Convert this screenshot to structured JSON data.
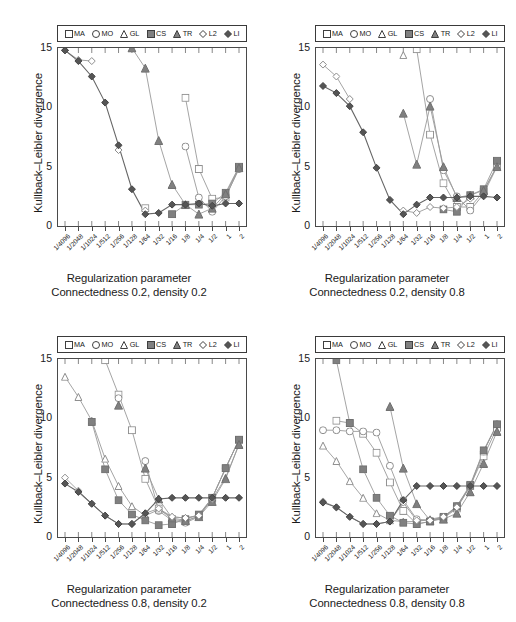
{
  "figure": {
    "background": "#ffffff",
    "axis_color": "#4a4a4a",
    "text_color": "#1a1a1a"
  },
  "legend": {
    "items": [
      {
        "label": "MA",
        "marker": "open-square",
        "name": "legend-marker-ma"
      },
      {
        "label": "MO",
        "marker": "open-circle",
        "name": "legend-marker-mo"
      },
      {
        "label": "GL",
        "marker": "open-triangle",
        "name": "legend-marker-gl"
      },
      {
        "label": "CS",
        "marker": "filled-square",
        "name": "legend-marker-cs"
      },
      {
        "label": "TR",
        "marker": "filled-triangle",
        "name": "legend-marker-tr"
      },
      {
        "label": "L2",
        "marker": "open-diamond",
        "name": "legend-marker-l2"
      },
      {
        "label": "LI",
        "marker": "filled-diamond",
        "name": "legend-marker-li"
      }
    ]
  },
  "series_style": {
    "MA": {
      "marker": "open-square",
      "fill": "#ffffff",
      "stroke": "#8c8c8c",
      "line": "#9a9a9a"
    },
    "MO": {
      "marker": "open-circle",
      "fill": "#ffffff",
      "stroke": "#8c8c8c",
      "line": "#9a9a9a"
    },
    "GL": {
      "marker": "open-triangle",
      "fill": "#ffffff",
      "stroke": "#8c8c8c",
      "line": "#9a9a9a"
    },
    "CS": {
      "marker": "filled-square",
      "fill": "#808080",
      "stroke": "#6e6e6e",
      "line": "#9a9a9a"
    },
    "TR": {
      "marker": "filled-triangle",
      "fill": "#808080",
      "stroke": "#6e6e6e",
      "line": "#9a9a9a"
    },
    "L2": {
      "marker": "open-diamond",
      "fill": "#ffffff",
      "stroke": "#8c8c8c",
      "line": "#9a9a9a"
    },
    "LI": {
      "marker": "filled-diamond",
      "fill": "#555555",
      "stroke": "#444444",
      "line": "#666666"
    }
  },
  "axes": {
    "xlabel": "Regularization parameter",
    "ylabel": "Kullback–Leibler divergence",
    "xticklabels": [
      "1/4096",
      "1/2048",
      "1/1024",
      "1/512",
      "1/256",
      "1/128",
      "1/64",
      "1/32",
      "1/16",
      "1/8",
      "1/4",
      "1/2",
      "1",
      "2"
    ],
    "yticklabels": [
      "0",
      "5",
      "10",
      "15"
    ],
    "yticks": [
      0,
      5,
      10,
      15
    ],
    "ylim": [
      0,
      15
    ]
  },
  "chart_data": [
    {
      "type": "line",
      "panel": "top-left",
      "title": "Connectedness 0.2, density 0.2",
      "subtitle_line1": "Regularization parameter",
      "subtitle_line2": "Connectedness 0.2, density 0.2",
      "xlabel": "Regularization parameter",
      "ylabel": "Kullback–Leibler divergence",
      "ylim": [
        0,
        15
      ],
      "grid": false,
      "legend_position": "above-plot",
      "categories": [
        "1/4096",
        "1/2048",
        "1/1024",
        "1/512",
        "1/256",
        "1/128",
        "1/64",
        "1/32",
        "1/16",
        "1/8",
        "1/4",
        "1/2",
        "1",
        "2"
      ],
      "series": [
        {
          "name": "MA",
          "values": [
            null,
            null,
            null,
            null,
            null,
            null,
            1.5,
            null,
            null,
            10.8,
            4.8,
            2.3,
            2.4,
            4.9
          ]
        },
        {
          "name": "MO",
          "values": [
            null,
            null,
            null,
            null,
            null,
            null,
            null,
            null,
            null,
            6.7,
            2.4,
            1.2,
            2.5,
            4.8
          ]
        },
        {
          "name": "GL",
          "values": [
            null,
            null,
            null,
            null,
            null,
            null,
            null,
            null,
            null,
            null,
            null,
            null,
            null,
            null
          ]
        },
        {
          "name": "CS",
          "values": [
            null,
            null,
            null,
            null,
            null,
            null,
            null,
            null,
            1.0,
            1.8,
            1.8,
            1.9,
            2.8,
            5.0
          ]
        },
        {
          "name": "TR",
          "values": [
            null,
            null,
            null,
            null,
            null,
            15.0,
            13.3,
            7.2,
            3.5,
            1.8,
            1.0,
            1.5,
            2.7,
            4.9
          ]
        },
        {
          "name": "L2",
          "values": [
            14.8,
            14.0,
            13.9,
            null,
            6.4,
            null,
            1.3,
            null,
            null,
            null,
            null,
            null,
            null,
            null
          ]
        },
        {
          "name": "LI",
          "values": [
            14.8,
            13.9,
            12.6,
            10.4,
            6.8,
            3.1,
            1.0,
            1.1,
            1.8,
            1.8,
            1.9,
            1.7,
            1.9,
            1.9
          ]
        }
      ]
    },
    {
      "type": "line",
      "panel": "top-right",
      "title": "Connectedness 0.2, density 0.8",
      "subtitle_line1": "Regularization parameter",
      "subtitle_line2": "Connectedness 0.2, density 0.8",
      "xlabel": "Regularization parameter",
      "ylabel": "Kullback–Leibler divergence",
      "ylim": [
        0,
        15
      ],
      "grid": false,
      "legend_position": "above-plot",
      "categories": [
        "1/4096",
        "1/2048",
        "1/1024",
        "1/512",
        "1/256",
        "1/128",
        "1/64",
        "1/32",
        "1/16",
        "1/8",
        "1/4",
        "1/2",
        "1",
        "2"
      ],
      "series": [
        {
          "name": "MA",
          "values": [
            null,
            null,
            null,
            null,
            null,
            null,
            null,
            14.9,
            7.7,
            3.6,
            1.6,
            1.6,
            2.9,
            5.1
          ]
        },
        {
          "name": "MO",
          "values": [
            null,
            null,
            null,
            null,
            null,
            null,
            null,
            null,
            10.7,
            4.7,
            2.5,
            1.3,
            2.7,
            5.0
          ]
        },
        {
          "name": "GL",
          "values": [
            null,
            null,
            null,
            null,
            null,
            null,
            14.4,
            null,
            null,
            null,
            null,
            null,
            null,
            null
          ]
        },
        {
          "name": "CS",
          "values": [
            null,
            null,
            null,
            null,
            null,
            null,
            null,
            null,
            null,
            1.4,
            1.2,
            2.6,
            3.1,
            5.5
          ]
        },
        {
          "name": "TR",
          "values": [
            null,
            null,
            null,
            null,
            null,
            null,
            9.5,
            5.2,
            10.1,
            5.0,
            2.4,
            2.6,
            3.0,
            5.0
          ]
        },
        {
          "name": "L2",
          "values": [
            13.6,
            12.6,
            10.7,
            null,
            null,
            null,
            1.3,
            1.1,
            1.6,
            1.5,
            1.6,
            2.3,
            null,
            null
          ]
        },
        {
          "name": "LI",
          "values": [
            11.8,
            11.2,
            10.1,
            7.9,
            4.9,
            2.2,
            1.0,
            1.8,
            2.4,
            2.4,
            2.4,
            2.5,
            2.5,
            2.4
          ]
        }
      ]
    },
    {
      "type": "line",
      "panel": "bottom-left",
      "title": "Connectedness 0.8, density 0.2",
      "subtitle_line1": "Regularization parameter",
      "subtitle_line2": "Connectedness 0.8, density 0.2",
      "xlabel": "Regularization parameter",
      "ylabel": "Kullback–Leibler divergence",
      "ylim": [
        0,
        15
      ],
      "grid": false,
      "legend_position": "above-plot",
      "categories": [
        "1/4096",
        "1/2048",
        "1/1024",
        "1/512",
        "1/256",
        "1/128",
        "1/64",
        "1/32",
        "1/16",
        "1/8",
        "1/4",
        "1/2",
        "1",
        "2"
      ],
      "series": [
        {
          "name": "MA",
          "values": [
            null,
            null,
            null,
            14.9,
            12.0,
            9.0,
            4.9,
            2.4,
            1.5,
            1.3,
            1.8,
            3.3,
            5.8,
            8.2
          ]
        },
        {
          "name": "MO",
          "values": [
            null,
            null,
            null,
            null,
            11.7,
            null,
            6.4,
            2.2,
            1.4,
            1.2,
            1.7,
            3.3,
            5.8,
            8.2
          ]
        },
        {
          "name": "GL",
          "values": [
            13.5,
            11.8,
            9.8,
            6.6,
            4.3,
            2.6,
            1.8,
            2.3,
            1.7,
            1.6,
            1.8,
            3.2,
            5.0,
            7.8
          ]
        },
        {
          "name": "CS",
          "values": [
            null,
            null,
            9.7,
            5.7,
            3.1,
            1.9,
            1.4,
            1.0,
            1.1,
            1.5,
            1.9,
            3.3,
            5.8,
            8.2
          ]
        },
        {
          "name": "TR",
          "values": [
            null,
            null,
            null,
            null,
            11.1,
            null,
            5.8,
            3.2,
            1.6,
            1.4,
            1.7,
            3.0,
            4.9,
            7.8
          ]
        },
        {
          "name": "L2",
          "values": [
            5.0,
            3.9,
            2.8,
            1.8,
            1.1,
            1.1,
            2.0,
            2.4,
            1.7,
            1.6,
            1.8,
            3.2,
            null,
            null
          ]
        },
        {
          "name": "LI",
          "values": [
            4.5,
            3.8,
            2.8,
            1.8,
            1.1,
            1.1,
            2.0,
            3.2,
            3.3,
            3.3,
            3.3,
            3.3,
            3.3,
            3.3
          ]
        }
      ]
    },
    {
      "type": "line",
      "panel": "bottom-right",
      "title": "Connectedness 0.8, density 0.8",
      "subtitle_line1": "Regularization parameter",
      "subtitle_line2": "Connectedness 0.8, density 0.8",
      "xlabel": "Regularization parameter",
      "ylabel": "Kullback–Leibler divergence",
      "ylim": [
        0,
        15
      ],
      "grid": false,
      "legend_position": "above-plot",
      "categories": [
        "1/4096",
        "1/2048",
        "1/1024",
        "1/512",
        "1/256",
        "1/128",
        "1/64",
        "1/32",
        "1/16",
        "1/8",
        "1/4",
        "1/2",
        "1",
        "2"
      ],
      "series": [
        {
          "name": "MA",
          "values": [
            null,
            9.8,
            9.6,
            8.7,
            7.1,
            4.6,
            2.2,
            1.1,
            1.3,
            1.6,
            2.4,
            4.3,
            6.8,
            9.2
          ]
        },
        {
          "name": "MO",
          "values": [
            9.0,
            9.0,
            8.9,
            8.9,
            8.8,
            6.0,
            3.1,
            1.5,
            1.4,
            1.6,
            2.6,
            4.3,
            7.2,
            9.5
          ]
        },
        {
          "name": "GL",
          "values": [
            7.7,
            6.4,
            4.7,
            3.3,
            2.0,
            1.4,
            1.3,
            1.3,
            1.5,
            1.7,
            2.5,
            4.3,
            7.2,
            9.5
          ]
        },
        {
          "name": "CS",
          "values": [
            null,
            14.9,
            9.6,
            5.7,
            3.3,
            1.8,
            1.2,
            1.1,
            1.3,
            1.7,
            2.6,
            4.4,
            7.3,
            9.5
          ]
        },
        {
          "name": "TR",
          "values": [
            null,
            null,
            null,
            null,
            null,
            11.0,
            5.8,
            2.8,
            1.4,
            1.5,
            2.0,
            3.8,
            6.2,
            8.9
          ]
        },
        {
          "name": "L2",
          "values": [
            3.0,
            2.5,
            1.7,
            1.1,
            1.1,
            1.3,
            2.9,
            1.4,
            1.4,
            1.7,
            2.5,
            4.3,
            null,
            null
          ]
        },
        {
          "name": "LI",
          "values": [
            2.9,
            2.5,
            1.7,
            1.1,
            1.1,
            1.3,
            3.1,
            4.3,
            4.3,
            4.3,
            4.3,
            4.3,
            4.3,
            4.3
          ]
        }
      ]
    }
  ]
}
